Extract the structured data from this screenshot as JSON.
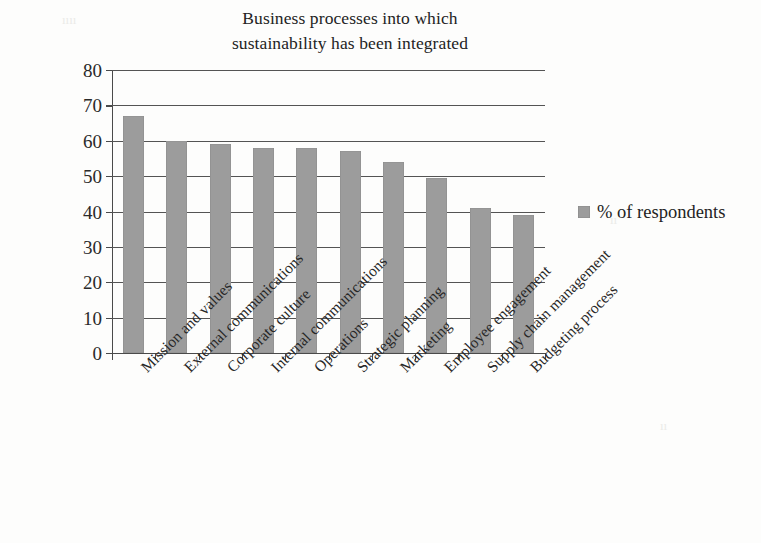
{
  "chart_data": {
    "type": "bar",
    "title": "Business processes into which sustainability has been integrated",
    "title_lines": [
      "Business processes into which",
      "sustainability has been integrated"
    ],
    "xlabel": "",
    "ylabel": "",
    "ylim": [
      0,
      80
    ],
    "ytick_step": 10,
    "yticks": [
      80,
      70,
      60,
      50,
      40,
      30,
      20,
      10,
      0
    ],
    "grid": true,
    "grid_axis": "y",
    "legend_position": "right",
    "categories": [
      "Mission and values",
      "External communications",
      "Corporate culture",
      "Internal communications",
      "Operations",
      "Strategic planning",
      "Marketing",
      "Employee engagement",
      "Supply chain management",
      "Budgeting process"
    ],
    "series": [
      {
        "name": "% of respondents",
        "color": "#9c9c9c",
        "values": [
          67,
          60,
          59,
          58,
          58,
          57,
          54,
          49.5,
          41,
          39
        ]
      }
    ]
  },
  "legend": {
    "label": "% of respondents",
    "swatch_color": "#9c9c9c"
  },
  "colors": {
    "bar": "#9c9c9c",
    "gridline": "#545454",
    "axis": "#4a4a4a",
    "text": "#232323",
    "background": "#fdfdfc"
  },
  "artifacts": [
    {
      "text": "ıııı",
      "left": 62,
      "top": 12
    },
    {
      "text": "ıı",
      "left": 610,
      "top": 212
    },
    {
      "text": "ıı",
      "left": 660,
      "top": 418
    }
  ]
}
